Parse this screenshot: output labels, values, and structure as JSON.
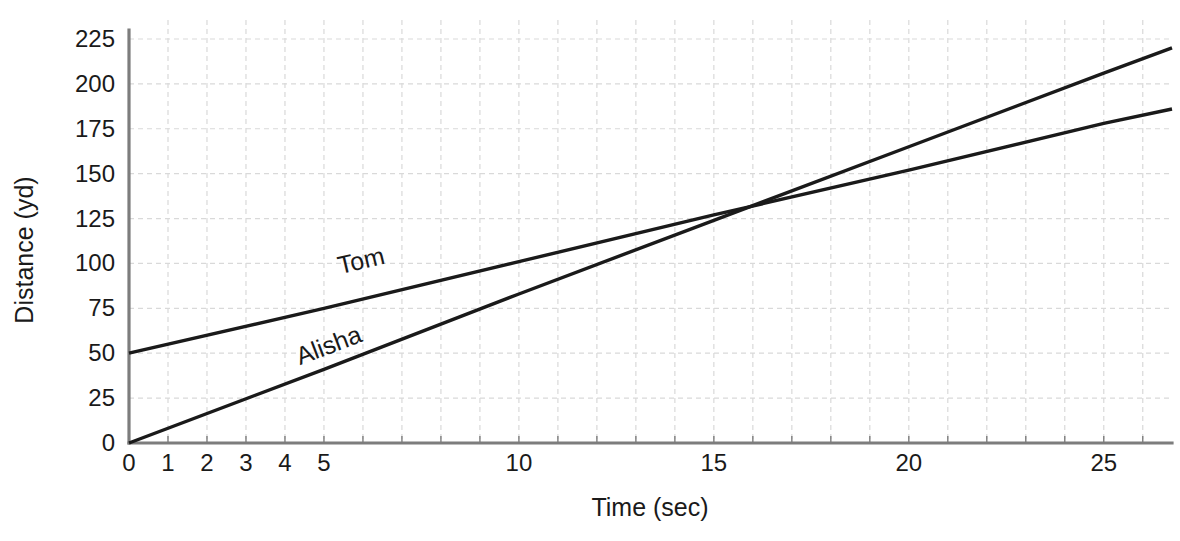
{
  "chart_data": {
    "type": "line",
    "title": "",
    "subtitle": "",
    "xlabel": "Time (sec)",
    "ylabel": "Distance (yd)",
    "xlim": [
      0,
      26.75
    ],
    "ylim": [
      0,
      230
    ],
    "grid": true,
    "legend_position": "inline-labels",
    "x_ticks": [
      0,
      1,
      2,
      3,
      4,
      5,
      10,
      15,
      20,
      25
    ],
    "x_tick_labels": [
      "0",
      "1",
      "2",
      "3",
      "4",
      "5",
      "10",
      "15",
      "20",
      "25"
    ],
    "x_minor_tick_step": 1,
    "y_ticks": [
      0,
      25,
      50,
      75,
      100,
      125,
      150,
      175,
      200,
      225
    ],
    "y_tick_labels": [
      "0",
      "25",
      "50",
      "75",
      "100",
      "125",
      "150",
      "175",
      "200",
      "225"
    ],
    "series": [
      {
        "name": "Tom",
        "label": "Tom",
        "color": "#1a1a1a",
        "intercept": 50,
        "slope": 5.1,
        "x": [
          0,
          26.75
        ],
        "values": [
          50,
          186
        ],
        "points": [
          [
            0,
            50
          ],
          [
            5,
            75
          ],
          [
            10,
            101
          ],
          [
            15,
            127
          ],
          [
            20,
            152
          ],
          [
            25,
            178
          ],
          [
            26.75,
            186
          ]
        ],
        "label_x": 6.0,
        "label_y": 97
      },
      {
        "name": "Alisha",
        "label": "Alisha",
        "color": "#1a1a1a",
        "intercept": 0,
        "slope": 8.25,
        "x": [
          0,
          26.75
        ],
        "values": [
          0,
          220
        ],
        "points": [
          [
            0,
            0
          ],
          [
            5,
            41
          ],
          [
            10,
            83
          ],
          [
            15,
            124
          ],
          [
            20,
            165
          ],
          [
            25,
            206
          ],
          [
            26.75,
            220
          ]
        ],
        "label_x": 5.2,
        "label_y": 50
      }
    ],
    "annotations": [
      {
        "name": "intersection",
        "x": 15.9,
        "y": 131,
        "text": ""
      }
    ]
  },
  "axes": {
    "x_title": "Time (sec)",
    "y_title": "Distance (yd)"
  }
}
